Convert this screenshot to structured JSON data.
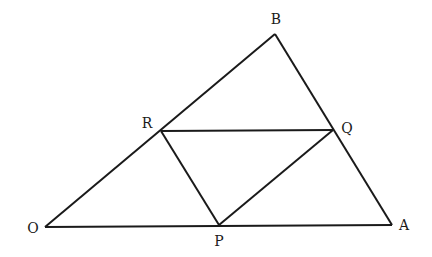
{
  "diagram": {
    "type": "geometry",
    "stroke_color": "#1a1a1a",
    "background": "#ffffff",
    "points": {
      "O": {
        "label": "O",
        "x": 45,
        "y": 227,
        "lx": 33,
        "ly": 233
      },
      "A": {
        "label": "A",
        "x": 392,
        "y": 225,
        "lx": 404,
        "ly": 230
      },
      "B": {
        "label": "B",
        "x": 275,
        "y": 34,
        "lx": 276,
        "ly": 24
      },
      "P": {
        "label": "P",
        "x": 219,
        "y": 225,
        "lx": 219,
        "ly": 245
      },
      "Q": {
        "label": "Q",
        "x": 333,
        "y": 130,
        "lx": 347,
        "ly": 133
      },
      "R": {
        "label": "R",
        "x": 161,
        "y": 131,
        "lx": 147,
        "ly": 128
      }
    },
    "segments": [
      [
        "O",
        "A"
      ],
      [
        "A",
        "B"
      ],
      [
        "B",
        "O"
      ],
      [
        "R",
        "Q"
      ],
      [
        "R",
        "P"
      ],
      [
        "P",
        "Q"
      ]
    ],
    "labels": {
      "O": "O",
      "A": "A",
      "B": "B",
      "P": "P",
      "Q": "Q",
      "R": "R"
    }
  }
}
